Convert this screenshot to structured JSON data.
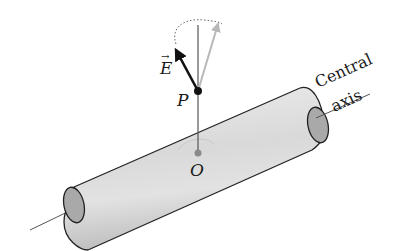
{
  "diagram": {
    "type": "physics-illustration",
    "labels": {
      "field_vector": "E",
      "point": "P",
      "origin": "O",
      "axis_line1": "Central",
      "axis_line2": "axis"
    },
    "elements": [
      {
        "name": "cylinder",
        "description": "long gray cylindrical shell with open elliptical ends"
      },
      {
        "name": "central-axis",
        "description": "thin line through the cylinder along its central axis"
      },
      {
        "name": "radial-line",
        "description": "line from O on the axis perpendicular up to point P and beyond"
      },
      {
        "name": "field-vector-E",
        "description": "dark arrow at P tilted away from the radial direction"
      },
      {
        "name": "ghost-vector",
        "description": "light gray arrow at P tilted the other way"
      },
      {
        "name": "rotation-arc",
        "description": "dotted arc indicating rotation of the vector about the radial line"
      },
      {
        "name": "origin-arc",
        "description": "faint arc around O on the cylinder surface"
      }
    ],
    "colors": {
      "cylinder_fill": "#d6d6d6",
      "cylinder_end": "#a9a9a9",
      "outline": "#222222",
      "vector_dark": "#111111",
      "vector_ghost": "#b8b8b8",
      "origin_dot": "#8a8a8a"
    }
  }
}
